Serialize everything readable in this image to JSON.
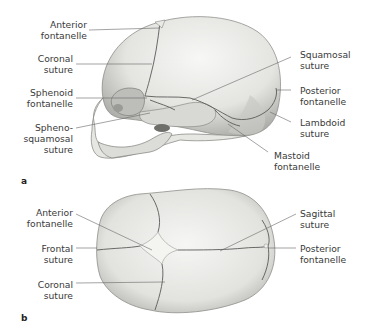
{
  "figure": {
    "panels": [
      {
        "id": "a",
        "letter": "a",
        "view": "lateral",
        "labels_left": [
          {
            "line1": "Anterior",
            "line2": "fontanelle"
          },
          {
            "line1": "Coronal",
            "line2": "suture"
          },
          {
            "line1": "Sphenoid",
            "line2": "fontanelle"
          },
          {
            "line1": "Spheno-",
            "line2": "squamosal",
            "line3": "suture"
          }
        ],
        "labels_right": [
          {
            "line1": "Squamosal",
            "line2": "suture"
          },
          {
            "line1": "Posterior",
            "line2": "fontanelle"
          },
          {
            "line1": "Lambdoid",
            "line2": "suture"
          },
          {
            "line1": "Mastoid",
            "line2": "fontanelle"
          }
        ]
      },
      {
        "id": "b",
        "letter": "b",
        "view": "superior",
        "labels_left": [
          {
            "line1": "Anterior",
            "line2": "fontanelle"
          },
          {
            "line1": "Frontal",
            "line2": "suture"
          },
          {
            "line1": "Coronal",
            "line2": "suture"
          }
        ],
        "labels_right": [
          {
            "line1": "Sagittal",
            "line2": "suture"
          },
          {
            "line1": "Posterior",
            "line2": "fontanelle"
          }
        ]
      }
    ],
    "colors": {
      "bone_light": "#f2f2f0",
      "bone_mid": "#d6d6d3",
      "bone_shadow": "#9c9c98",
      "suture": "#5a5a58",
      "leader": "#666666",
      "text": "#3a3a3a"
    }
  }
}
